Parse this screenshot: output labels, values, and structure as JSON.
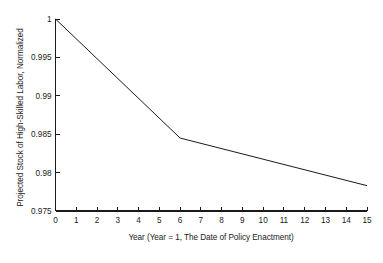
{
  "chart_data": {
    "type": "line",
    "title": "",
    "xlabel": "Year  (Year = 1, The Date of Policy Enactment)",
    "ylabel": "Projected Stock of High-Skilled Labor, Normalized",
    "xlim": [
      0,
      15
    ],
    "ylim": [
      0.975,
      1
    ],
    "xticks": [
      0,
      1,
      2,
      3,
      4,
      5,
      6,
      7,
      8,
      9,
      10,
      11,
      12,
      13,
      14,
      15
    ],
    "xtick_labels": [
      "0",
      "1",
      "2",
      "3",
      "4",
      "5",
      "6",
      "7",
      "8",
      "9",
      "10",
      "11",
      "12",
      "13",
      "14",
      "15"
    ],
    "yticks": [
      0.975,
      0.98,
      0.985,
      0.99,
      0.995,
      1
    ],
    "ytick_labels": [
      "0.975",
      "0.98",
      "0.985",
      "0.99",
      "0.995",
      "1"
    ],
    "grid": false,
    "legend": false,
    "spines": [
      "left",
      "bottom"
    ],
    "tick_direction": "in",
    "series": [
      {
        "name": "Projected Stock of High-Skilled Labor",
        "color": "#1a1a1a",
        "linewidth": 1,
        "x": [
          0,
          6,
          15
        ],
        "values": [
          1.0,
          0.9845,
          0.9783
        ]
      }
    ],
    "annotations": []
  },
  "figure": {
    "background": "#ffffff",
    "axis_color": "#1a1a1a"
  }
}
